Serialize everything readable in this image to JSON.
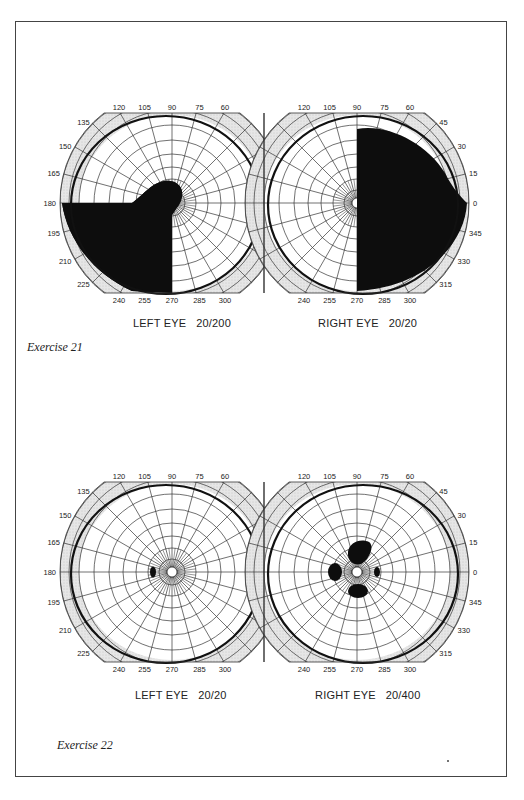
{
  "page": {
    "exercises": [
      {
        "caption": "Exercise 21",
        "caption_pos": [
          27,
          347
        ],
        "center_y": 203,
        "left_eye": {
          "label": "LEFT EYE   20/200",
          "acuity": "20/200",
          "center_x": 172,
          "label_pos": [
            133,
            324
          ],
          "isopter": "ellipse",
          "scotomas": [
            "left-lower-hemianopia-with-upper-bulge"
          ]
        },
        "right_eye": {
          "label": "RIGHT EYE   20/20",
          "acuity": "20/20",
          "center_x": 357,
          "label_pos": [
            318,
            324
          ],
          "isopter": "ellipse",
          "scotomas": [
            "right-hemianopia"
          ]
        }
      },
      {
        "caption": "Exercise 22",
        "caption_pos": [
          57,
          745
        ],
        "center_y": 572,
        "left_eye": {
          "label": "LEFT EYE   20/20",
          "acuity": "20/20",
          "center_x": 172,
          "label_pos": [
            135,
            694
          ],
          "isopter": "ellipse",
          "scotomas": [
            "blind-spot-small"
          ]
        },
        "right_eye": {
          "label": "RIGHT EYE   20/400",
          "acuity": "20/400",
          "center_x": 357,
          "label_pos": [
            316,
            694
          ],
          "isopter": "ellipse",
          "scotomas": [
            "central-cluster"
          ]
        }
      }
    ]
  },
  "chart_data": {
    "type": "polar-visual-field",
    "meridian_labels_top": [
      "120",
      "105",
      "90",
      "75",
      "60"
    ],
    "meridian_labels_left_side": [
      "135",
      "150",
      "165",
      "180",
      "195",
      "210",
      "225"
    ],
    "meridian_labels_right_side": [
      "45",
      "30",
      "15",
      "0",
      "345",
      "330",
      "315"
    ],
    "meridian_labels_bottom": [
      "240",
      "255",
      "270",
      "285",
      "300"
    ],
    "meridian_step_deg": 15,
    "rings": 9,
    "charts": [
      {
        "exercise": "Exercise 21",
        "eye": "LEFT EYE",
        "acuity": "20/200",
        "defect": "Dense inferior-left defect from 180° to 270° with bulge into upper field near center"
      },
      {
        "exercise": "Exercise 21",
        "eye": "RIGHT EYE",
        "acuity": "20/20",
        "defect": "Complete right (temporal) hemianopia from 90° to 270°"
      },
      {
        "exercise": "Exercise 22",
        "eye": "LEFT EYE",
        "acuity": "20/20",
        "defect": "Small blind spot near 180° close to fixation"
      },
      {
        "exercise": "Exercise 22",
        "eye": "RIGHT EYE",
        "acuity": "20/400",
        "defect": "Central scotoma cluster surrounding fixation"
      }
    ],
    "footer_dot": "•"
  }
}
